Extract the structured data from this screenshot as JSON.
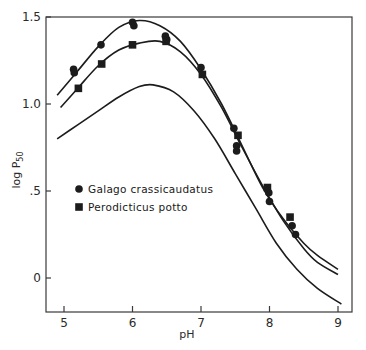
{
  "chart_data": {
    "type": "line",
    "title": "",
    "xlabel": "pH",
    "ylabel": "log P50",
    "xlim": [
      4.7,
      9.2
    ],
    "ylim": [
      -0.2,
      1.5
    ],
    "x_ticks": [
      "5",
      "6",
      "7",
      "8",
      "9"
    ],
    "y_ticks": [
      "0",
      ".5",
      "1.0",
      "1.5"
    ],
    "grid": false,
    "legend_position": "center-left",
    "legend": [
      {
        "name": "Galago crassicaudatus",
        "marker": "circle"
      },
      {
        "name": "Perodicticus potto",
        "marker": "square"
      }
    ],
    "series": [
      {
        "name": "Galago crassicaudatus",
        "marker": "circle",
        "points": [
          [
            5.14,
            1.2
          ],
          [
            5.15,
            1.18
          ],
          [
            5.54,
            1.34
          ],
          [
            6.0,
            1.47
          ],
          [
            6.02,
            1.45
          ],
          [
            6.48,
            1.39
          ],
          [
            6.5,
            1.37
          ],
          [
            7.0,
            1.21
          ],
          [
            7.48,
            0.86
          ],
          [
            7.52,
            0.76
          ],
          [
            7.52,
            0.73
          ],
          [
            7.99,
            0.49
          ],
          [
            8.0,
            0.44
          ],
          [
            8.33,
            0.3
          ],
          [
            8.38,
            0.25
          ]
        ],
        "curve": [
          [
            4.9,
            1.05
          ],
          [
            5.2,
            1.19
          ],
          [
            5.5,
            1.33
          ],
          [
            5.8,
            1.44
          ],
          [
            6.1,
            1.48
          ],
          [
            6.4,
            1.45
          ],
          [
            6.7,
            1.36
          ],
          [
            7.0,
            1.2
          ],
          [
            7.3,
            1.0
          ],
          [
            7.6,
            0.76
          ],
          [
            7.9,
            0.52
          ],
          [
            8.2,
            0.34
          ],
          [
            8.5,
            0.2
          ],
          [
            8.7,
            0.13
          ],
          [
            9.0,
            0.05
          ]
        ]
      },
      {
        "name": "Perodicticus potto",
        "marker": "square",
        "points": [
          [
            5.21,
            1.09
          ],
          [
            5.55,
            1.23
          ],
          [
            6.0,
            1.34
          ],
          [
            6.49,
            1.36
          ],
          [
            7.02,
            1.17
          ],
          [
            7.54,
            0.82
          ],
          [
            7.97,
            0.52
          ],
          [
            8.3,
            0.35
          ]
        ],
        "curve": [
          [
            4.95,
            0.98
          ],
          [
            5.2,
            1.09
          ],
          [
            5.5,
            1.22
          ],
          [
            5.8,
            1.31
          ],
          [
            6.1,
            1.35
          ],
          [
            6.4,
            1.36
          ],
          [
            6.7,
            1.3
          ],
          [
            7.0,
            1.17
          ],
          [
            7.3,
            0.98
          ],
          [
            7.6,
            0.75
          ],
          [
            7.9,
            0.53
          ],
          [
            8.2,
            0.33
          ],
          [
            8.5,
            0.17
          ],
          [
            8.7,
            0.09
          ],
          [
            9.0,
            0.02
          ]
        ]
      },
      {
        "name": "Unlabeled reference curve",
        "marker": "none",
        "curve": [
          [
            4.9,
            0.8
          ],
          [
            5.2,
            0.88
          ],
          [
            5.5,
            0.96
          ],
          [
            5.8,
            1.04
          ],
          [
            6.1,
            1.1
          ],
          [
            6.3,
            1.11
          ],
          [
            6.6,
            1.07
          ],
          [
            6.9,
            0.96
          ],
          [
            7.2,
            0.8
          ],
          [
            7.5,
            0.6
          ],
          [
            7.8,
            0.4
          ],
          [
            8.1,
            0.2
          ],
          [
            8.4,
            0.05
          ],
          [
            8.7,
            -0.06
          ],
          [
            9.05,
            -0.15
          ]
        ]
      }
    ]
  },
  "axes": {
    "x_title": "pH",
    "y_title_main": "log P",
    "y_title_sub": "50"
  }
}
